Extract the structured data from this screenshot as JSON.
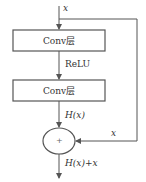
{
  "diagram": {
    "input_label": "x",
    "layers": [
      {
        "label": "Conv层"
      },
      {
        "label": "Conv层"
      }
    ],
    "activation_label": "ReLU",
    "output_of_layers_label": "H(x)",
    "skip_label": "x",
    "adder_symbol": "+",
    "output_label": "H(x)+x",
    "colors": {
      "line": "#555555",
      "box_border": "#555555",
      "text": "#333333",
      "background": "#ffffff"
    }
  }
}
